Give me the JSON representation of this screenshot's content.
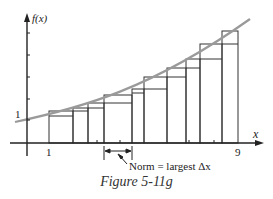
{
  "figure": {
    "caption": "Figure 5-11g",
    "y_axis_label": "f(x)",
    "x_axis_label": "x",
    "y_tick_label": "1",
    "x_tick_labels": [
      {
        "label": "1",
        "x": 49
      },
      {
        "label": "9",
        "x": 238
      }
    ],
    "annotation": "Norm = largest Δx",
    "colors": {
      "axis": "#222222",
      "rectangles": "#333333",
      "curve": "#9a9a9a"
    }
  },
  "chart_data": {
    "type": "diagram",
    "title": "Figure 5-11g",
    "xlabel": "x",
    "ylabel": "f(x)",
    "partition_pixels_x": [
      49,
      73,
      88,
      104,
      132,
      144,
      167,
      186,
      200,
      222,
      238
    ],
    "rectangles": [
      {
        "x0": 49,
        "x1": 73,
        "lower_top": 116,
        "upper_top": 111
      },
      {
        "x0": 73,
        "x1": 88,
        "lower_top": 111,
        "upper_top": 108
      },
      {
        "x0": 88,
        "x1": 104,
        "lower_top": 108,
        "upper_top": 103
      },
      {
        "x0": 104,
        "x1": 132,
        "lower_top": 103,
        "upper_top": 95
      },
      {
        "x0": 132,
        "x1": 144,
        "lower_top": 93,
        "upper_top": 89
      },
      {
        "x0": 144,
        "x1": 167,
        "lower_top": 89,
        "upper_top": 77
      },
      {
        "x0": 167,
        "x1": 186,
        "lower_top": 77,
        "upper_top": 68
      },
      {
        "x0": 186,
        "x1": 200,
        "lower_top": 68,
        "upper_top": 59
      },
      {
        "x0": 200,
        "x1": 222,
        "lower_top": 59,
        "upper_top": 44
      },
      {
        "x0": 222,
        "x1": 238,
        "lower_top": 44,
        "upper_top": 31
      }
    ],
    "x_range": [
      1,
      9
    ],
    "y_intercept_label": "1",
    "norm_interval_pixels": [
      104,
      132
    ]
  }
}
